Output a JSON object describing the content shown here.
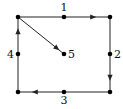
{
  "diagram": {
    "type": "directed-graph",
    "colors": {
      "line": "#222222",
      "node": "#000000",
      "background": "#ffffff"
    },
    "nodes": [
      {
        "id": "tl",
        "x": 18,
        "y": 17
      },
      {
        "id": "n1",
        "x": 64,
        "y": 17,
        "label": "1",
        "lx": 64,
        "ly": 11,
        "anchor": "middle"
      },
      {
        "id": "tr",
        "x": 110,
        "y": 17
      },
      {
        "id": "n2",
        "x": 110,
        "y": 54,
        "label": "2",
        "lx": 114,
        "ly": 58,
        "anchor": "start"
      },
      {
        "id": "br",
        "x": 110,
        "y": 92
      },
      {
        "id": "n3",
        "x": 64,
        "y": 92,
        "label": "3",
        "lx": 64,
        "ly": 104,
        "anchor": "middle"
      },
      {
        "id": "bl",
        "x": 18,
        "y": 92
      },
      {
        "id": "n4",
        "x": 18,
        "y": 54,
        "label": "4",
        "lx": 14,
        "ly": 58,
        "anchor": "end"
      },
      {
        "id": "n5",
        "x": 64,
        "y": 54,
        "label": "5",
        "lx": 68,
        "ly": 58,
        "anchor": "start"
      }
    ],
    "edges": [
      {
        "from": "tl",
        "to": "tr",
        "arrow_at": 0.85
      },
      {
        "from": "tr",
        "to": "br",
        "arrow_at": 0.85
      },
      {
        "from": "br",
        "to": "bl",
        "arrow_at": 0.85
      },
      {
        "from": "bl",
        "to": "tl",
        "arrow_at": 0.85
      },
      {
        "from": "tl",
        "to": "n5",
        "arrow_at": 0.9
      }
    ],
    "labels": [
      "1",
      "2",
      "3",
      "4",
      "5"
    ]
  }
}
